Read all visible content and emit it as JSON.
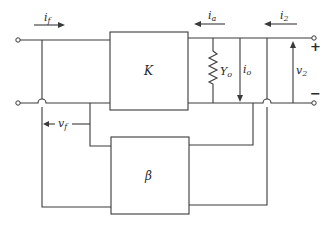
{
  "diagram": {
    "type": "feedback amplifier block diagram",
    "blocks": [
      {
        "id": "forward",
        "label": "K"
      },
      {
        "id": "feedback",
        "label": "β"
      }
    ],
    "labels": {
      "input_current": "i",
      "input_current_sub": "f",
      "amp_current": "i",
      "amp_current_sub": "a",
      "output_current": "i",
      "output_current_sub": "2",
      "output_admittance": "Y",
      "output_admittance_sub": "o",
      "load_current": "i",
      "load_current_sub": "o",
      "output_voltage": "v",
      "output_voltage_sub": "2",
      "feedback_voltage": "v",
      "feedback_voltage_sub": "f",
      "plus_sign": "+",
      "minus_sign": "−"
    },
    "colors": {
      "line": "#3a3a3a",
      "background": "#ffffff"
    }
  }
}
